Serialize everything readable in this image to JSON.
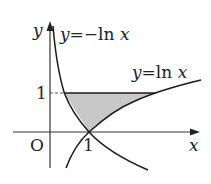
{
  "figure": {
    "axes": {
      "x_label": "x",
      "y_label": "y",
      "origin_label": "O",
      "x_tick_label": "1",
      "y_tick_label": "1"
    },
    "curves": [
      {
        "name": "y=-ln x",
        "label_y": "y",
        "label_eq": "=",
        "label_rhs": "−ln",
        "label_var": "x"
      },
      {
        "name": "y=ln x",
        "label_y": "y",
        "label_eq": "=",
        "label_rhs": "ln",
        "label_var": "x"
      }
    ],
    "shaded_region": "Region bounded by y=-ln x, y=ln x, and y=1",
    "colors": {
      "curve": "#1a1a1a",
      "axis": "#333333",
      "fill": "#c8c8c8",
      "text": "#222222"
    }
  }
}
